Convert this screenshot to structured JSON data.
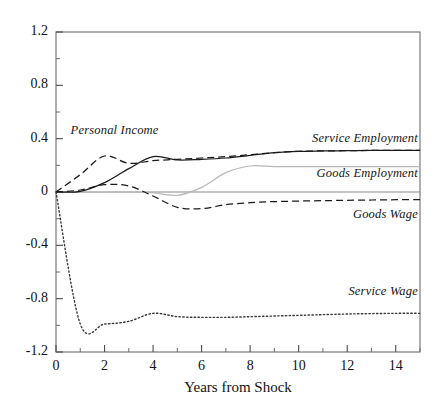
{
  "chart_data": {
    "type": "line",
    "title": "",
    "xlabel": "Years from Shock",
    "ylabel": "",
    "xlim": [
      0,
      15
    ],
    "ylim": [
      -1.2,
      1.2
    ],
    "grid": false,
    "legend_position": "inline-annotations",
    "xticks": [
      0,
      2,
      4,
      6,
      8,
      10,
      12,
      14
    ],
    "xtick_labels": [
      "0",
      "2",
      "4",
      "6",
      "8",
      "10",
      "12",
      "14"
    ],
    "x_minor_ticks": [
      1,
      3,
      5,
      7,
      9,
      11,
      13,
      15
    ],
    "yticks": [
      -1.2,
      -0.8,
      -0.4,
      0,
      0.4,
      0.8,
      1.2
    ],
    "ytick_labels": [
      "-1.2",
      "-0.8",
      "-0.4",
      "0",
      "0.4",
      "0.8",
      "1.2"
    ],
    "y_minor_ticks": [
      -1.0,
      -0.6,
      -0.2,
      0.2,
      0.6,
      1.0
    ],
    "zero_line": 0,
    "x": [
      0,
      1,
      2,
      3,
      4,
      5,
      6,
      7,
      8,
      9,
      10,
      11,
      12,
      13,
      14,
      15
    ],
    "series": [
      {
        "name": "Personal Income",
        "style": "dashed",
        "color": "#1a1a1a",
        "values": [
          0.0,
          0.13,
          0.27,
          0.215,
          0.235,
          0.245,
          0.255,
          0.265,
          0.28,
          0.295,
          0.305,
          0.308,
          0.31,
          0.312,
          0.313,
          0.313
        ]
      },
      {
        "name": "Service Employment",
        "style": "solid",
        "color": "#1a1a1a",
        "values": [
          0.0,
          0.005,
          0.07,
          0.175,
          0.265,
          0.24,
          0.245,
          0.255,
          0.275,
          0.295,
          0.305,
          0.308,
          0.31,
          0.312,
          0.313,
          0.313
        ]
      },
      {
        "name": "Goods Employment",
        "style": "solid",
        "color": "#b8b8b8",
        "values": [
          0.0,
          0.0,
          0.0,
          0.0,
          -0.005,
          -0.025,
          0.035,
          0.145,
          0.195,
          0.19,
          0.19,
          0.19,
          0.19,
          0.19,
          0.19,
          0.19
        ]
      },
      {
        "name": "Goods Wage",
        "style": "dashed",
        "color": "#1a1a1a",
        "values": [
          0.0,
          0.015,
          0.055,
          0.045,
          -0.03,
          -0.115,
          -0.125,
          -0.095,
          -0.08,
          -0.072,
          -0.068,
          -0.065,
          -0.062,
          -0.06,
          -0.058,
          -0.057
        ]
      },
      {
        "name": "Service Wage",
        "style": "dotted",
        "color": "#3a3a3a",
        "values": [
          0.0,
          -0.99,
          -0.99,
          -0.97,
          -0.91,
          -0.935,
          -0.94,
          -0.94,
          -0.935,
          -0.93,
          -0.925,
          -0.92,
          -0.915,
          -0.912,
          -0.91,
          -0.91
        ]
      }
    ],
    "annotations": [
      {
        "text": "Personal Income",
        "x": 0.6,
        "y": 0.46
      },
      {
        "text": "Service Employment",
        "x": 9.8,
        "y": 0.4
      },
      {
        "text": "Goods Employment",
        "x": 9.9,
        "y": 0.135
      },
      {
        "text": "Goods Wage",
        "x": 10.6,
        "y": -0.17
      },
      {
        "text": "Service Wage",
        "x": 10.6,
        "y": -0.75
      }
    ]
  }
}
